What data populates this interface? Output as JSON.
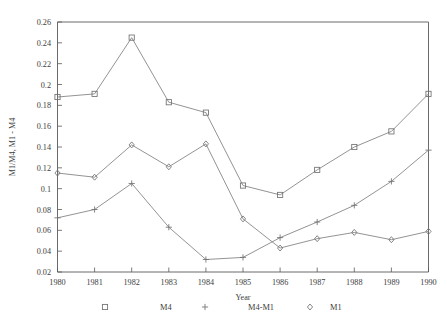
{
  "chart_data": {
    "type": "line",
    "title": "",
    "xlabel": "Year",
    "ylabel": "M1/M4, M1 - M4",
    "categories": [
      "1980",
      "1981",
      "1982",
      "1983",
      "1984",
      "1985",
      "1986",
      "1987",
      "1988",
      "1989",
      "1990"
    ],
    "x": [
      1980,
      1981,
      1982,
      1983,
      1984,
      1985,
      1986,
      1987,
      1988,
      1989,
      1990
    ],
    "xlim": [
      1980,
      1990
    ],
    "ylim": [
      0.02,
      0.26
    ],
    "ytick_labels": [
      "0.02",
      "0.04",
      "0.06",
      "0.08",
      "0.1",
      "0.12",
      "0.14",
      "0.16",
      "0.18",
      "0.2",
      "0.22",
      "0.24",
      "0.26"
    ],
    "yticks": [
      0.02,
      0.04,
      0.06,
      0.08,
      0.1,
      0.12,
      0.14,
      0.16,
      0.18,
      0.2,
      0.22,
      0.24,
      0.26
    ],
    "grid": false,
    "legend_position": "bottom",
    "series": [
      {
        "name": "M4",
        "marker": "square",
        "values": [
          0.188,
          0.191,
          0.245,
          0.183,
          0.173,
          0.103,
          0.094,
          0.118,
          0.14,
          0.155,
          0.191
        ]
      },
      {
        "name": "M4-M1",
        "marker": "plus",
        "values": [
          0.072,
          0.08,
          0.105,
          0.063,
          0.032,
          0.034,
          0.053,
          0.068,
          0.084,
          0.107,
          0.137
        ]
      },
      {
        "name": "M1",
        "marker": "diamond",
        "values": [
          0.115,
          0.111,
          0.142,
          0.121,
          0.143,
          0.071,
          0.043,
          0.052,
          0.058,
          0.051,
          0.059
        ]
      }
    ],
    "colors": {
      "line": "#808080",
      "axis": "#5a5a5a",
      "text": "#3d3d3d",
      "background": "#ffffff"
    }
  },
  "legend": {
    "entries": [
      {
        "label": "M4",
        "marker": "square"
      },
      {
        "label": "M4-M1",
        "marker": "plus"
      },
      {
        "label": "M1",
        "marker": "diamond"
      }
    ]
  }
}
